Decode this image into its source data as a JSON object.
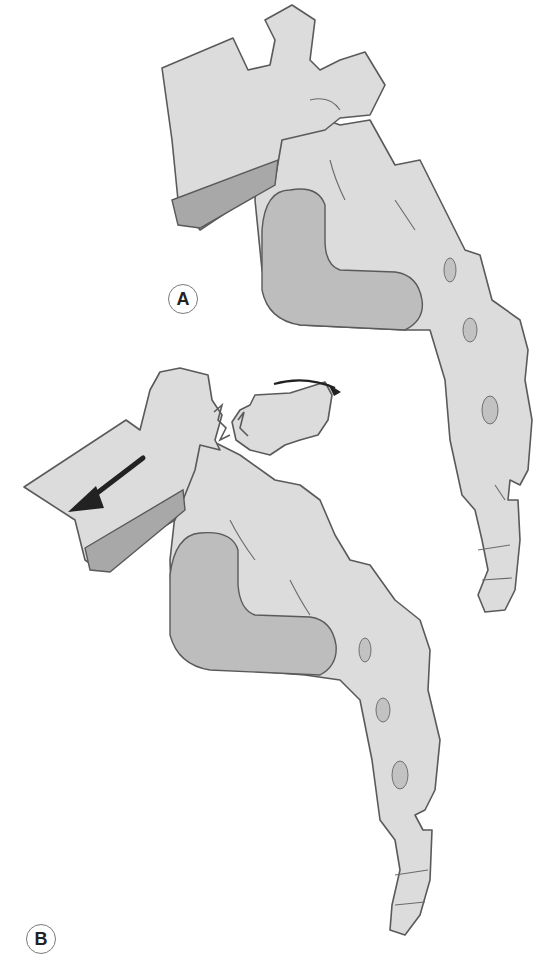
{
  "figure": {
    "panels": [
      {
        "id": "A",
        "label": "A",
        "description": "Lumbar vertebra seated on sacrum and coccyx, normal alignment"
      },
      {
        "id": "B",
        "label": "B",
        "description": "Pars interarticularis fracture with anterior slip of vertebral body (spondylolisthesis)"
      }
    ],
    "annotations": {
      "slip_arrow": "anterior-displacement-arrow",
      "rotation_arrow": "posterior-element-rotation-arrow",
      "fracture": "pars-fracture-line"
    },
    "colors": {
      "bone_fill": "#dcdcdc",
      "outline": "#5a5a5a",
      "disc": "#a8a8a8",
      "auricular_surface": "#bdbdbd",
      "arrow": "#222222"
    }
  }
}
